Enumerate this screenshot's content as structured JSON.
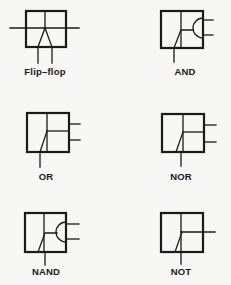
{
  "colors": {
    "ink": "#1a1a1a",
    "background": "#f7f7f5"
  },
  "symbols": [
    {
      "id": "flip-flop",
      "label": "Flip–flop",
      "inputs": 2,
      "outputs": 2
    },
    {
      "id": "and",
      "label": "AND",
      "inputs": 1,
      "outputs": 2
    },
    {
      "id": "or",
      "label": "OR",
      "inputs": 1,
      "outputs": 2
    },
    {
      "id": "nor",
      "label": "NOR",
      "inputs": 1,
      "outputs": 2
    },
    {
      "id": "nand",
      "label": "NAND",
      "inputs": 1,
      "outputs": 2
    },
    {
      "id": "not",
      "label": "NOT",
      "inputs": 1,
      "outputs": 1
    }
  ]
}
